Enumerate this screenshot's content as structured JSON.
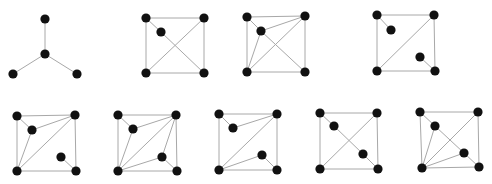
{
  "style": {
    "edge_color": "#a8a8a8",
    "node_color": "#111111",
    "node_radius": 4.6,
    "background": "#ffffff"
  },
  "graphs": [
    {
      "id": "g1",
      "nodes": {
        "top": [
          45,
          19
        ],
        "center": [
          45,
          54
        ],
        "bl": [
          13,
          74
        ],
        "br": [
          77,
          74
        ]
      },
      "edges": [
        [
          "top",
          "center"
        ],
        [
          "center",
          "bl"
        ],
        [
          "center",
          "br"
        ]
      ]
    },
    {
      "id": "g2",
      "nodes": {
        "tl": [
          146,
          18
        ],
        "tr": [
          204,
          18
        ],
        "in1": [
          161,
          32
        ],
        "bl": [
          146,
          73
        ],
        "br": [
          204,
          73
        ]
      },
      "edges": [
        [
          "tl",
          "tr"
        ],
        [
          "tl",
          "bl"
        ],
        [
          "tr",
          "br"
        ],
        [
          "bl",
          "br"
        ],
        [
          "tl",
          "in1"
        ],
        [
          "in1",
          "br"
        ],
        [
          "tr",
          "bl"
        ]
      ]
    },
    {
      "id": "g3",
      "nodes": {
        "tl": [
          247,
          17
        ],
        "tr": [
          305,
          16
        ],
        "in1": [
          261,
          31
        ],
        "bl": [
          247,
          72
        ],
        "br": [
          305,
          72
        ]
      },
      "edges": [
        [
          "tl",
          "tr"
        ],
        [
          "tl",
          "bl"
        ],
        [
          "tr",
          "br"
        ],
        [
          "bl",
          "br"
        ],
        [
          "tl",
          "in1"
        ],
        [
          "in1",
          "tr"
        ],
        [
          "in1",
          "bl"
        ],
        [
          "in1",
          "br"
        ],
        [
          "tr",
          "bl"
        ]
      ]
    },
    {
      "id": "g4",
      "nodes": {
        "tl": [
          377,
          15
        ],
        "tr": [
          434,
          15
        ],
        "in1": [
          391,
          30
        ],
        "in2": [
          420,
          57
        ],
        "bl": [
          377,
          71
        ],
        "br": [
          435,
          71
        ]
      },
      "edges": [
        [
          "tl",
          "tr"
        ],
        [
          "tl",
          "bl"
        ],
        [
          "tr",
          "br"
        ],
        [
          "bl",
          "br"
        ],
        [
          "tl",
          "in1"
        ],
        [
          "tr",
          "bl"
        ],
        [
          "in2",
          "br"
        ]
      ]
    },
    {
      "id": "g5",
      "nodes": {
        "tl": [
          17,
          116
        ],
        "tr": [
          75,
          115
        ],
        "in1": [
          32,
          130
        ],
        "in2": [
          61,
          157
        ],
        "bl": [
          17,
          171
        ],
        "br": [
          76,
          171
        ]
      },
      "edges": [
        [
          "tl",
          "tr"
        ],
        [
          "tl",
          "bl"
        ],
        [
          "tr",
          "br"
        ],
        [
          "bl",
          "br"
        ],
        [
          "tl",
          "in1"
        ],
        [
          "in1",
          "tr"
        ],
        [
          "in1",
          "bl"
        ],
        [
          "tr",
          "bl"
        ],
        [
          "in2",
          "br"
        ]
      ]
    },
    {
      "id": "g6",
      "nodes": {
        "tl": [
          118,
          115
        ],
        "tr": [
          176,
          115
        ],
        "in1": [
          133,
          129
        ],
        "in2": [
          162,
          157
        ],
        "bl": [
          118,
          171
        ],
        "br": [
          177,
          171
        ]
      },
      "edges": [
        [
          "tl",
          "tr"
        ],
        [
          "tl",
          "bl"
        ],
        [
          "tr",
          "br"
        ],
        [
          "bl",
          "br"
        ],
        [
          "tl",
          "in1"
        ],
        [
          "in1",
          "tr"
        ],
        [
          "in1",
          "bl"
        ],
        [
          "tr",
          "bl"
        ],
        [
          "tr",
          "in2"
        ],
        [
          "in2",
          "bl"
        ],
        [
          "in2",
          "br"
        ]
      ]
    },
    {
      "id": "g7",
      "nodes": {
        "tl": [
          219,
          114
        ],
        "tr": [
          277,
          114
        ],
        "in1": [
          233,
          128
        ],
        "in2": [
          262,
          155
        ],
        "bl": [
          219,
          170
        ],
        "br": [
          277,
          170
        ]
      },
      "edges": [
        [
          "tl",
          "tr"
        ],
        [
          "tl",
          "bl"
        ],
        [
          "tr",
          "br"
        ],
        [
          "bl",
          "br"
        ],
        [
          "tl",
          "in1"
        ],
        [
          "in1",
          "tr"
        ],
        [
          "tr",
          "bl"
        ],
        [
          "bl",
          "in2"
        ],
        [
          "in2",
          "br"
        ]
      ]
    },
    {
      "id": "g8",
      "nodes": {
        "tl": [
          320,
          113
        ],
        "tr": [
          377,
          113
        ],
        "in1": [
          334,
          126
        ],
        "in2": [
          363,
          154
        ],
        "bl": [
          320,
          169
        ],
        "br": [
          378,
          169
        ]
      },
      "edges": [
        [
          "tl",
          "tr"
        ],
        [
          "tl",
          "bl"
        ],
        [
          "tr",
          "br"
        ],
        [
          "bl",
          "br"
        ],
        [
          "tl",
          "in1"
        ],
        [
          "in1",
          "in2"
        ],
        [
          "in2",
          "br"
        ],
        [
          "tr",
          "bl"
        ]
      ]
    },
    {
      "id": "g9",
      "nodes": {
        "tl": [
          420,
          112
        ],
        "tr": [
          478,
          112
        ],
        "in1": [
          435,
          126
        ],
        "in2": [
          464,
          153
        ],
        "bl": [
          422,
          168
        ],
        "br": [
          479,
          167
        ]
      },
      "edges": [
        [
          "tl",
          "tr"
        ],
        [
          "tl",
          "bl"
        ],
        [
          "tr",
          "br"
        ],
        [
          "bl",
          "br"
        ],
        [
          "tl",
          "in1"
        ],
        [
          "in1",
          "in2"
        ],
        [
          "in2",
          "br"
        ],
        [
          "tr",
          "bl"
        ],
        [
          "bl",
          "in1"
        ],
        [
          "bl",
          "in2"
        ]
      ]
    }
  ]
}
